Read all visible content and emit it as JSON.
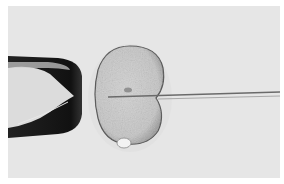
{
  "image": {
    "subject": "intracytoplasmic sperm injection micrograph",
    "elements": [
      "holding-pipette",
      "oocyte",
      "polar-body",
      "injection-needle"
    ],
    "colors": {
      "background": "#e6e6e6",
      "page": "#ffffff",
      "pipette_dark": "#111111",
      "pipette_inner": "#dcdcdc",
      "oocyte_fill": "#c9c9c9",
      "oocyte_rim": "#555555",
      "zona": "#d8d8d8",
      "needle": "#6a6a6a",
      "polar_body": "#f2f2f2"
    }
  }
}
